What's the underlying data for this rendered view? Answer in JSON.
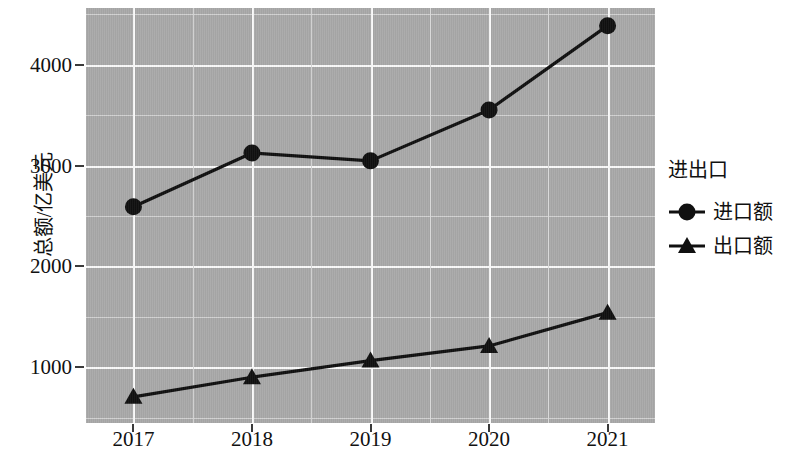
{
  "chart_data": {
    "type": "line",
    "title": "",
    "xlabel": "",
    "ylabel": "总额/亿美元",
    "categories": [
      "2017",
      "2018",
      "2019",
      "2020",
      "2021"
    ],
    "x": [
      2017,
      2018,
      2019,
      2020,
      2021
    ],
    "xlim": [
      2016.6,
      2021.4
    ],
    "ylim": [
      450,
      4560
    ],
    "y_ticks": [
      1000,
      2000,
      3000,
      4000
    ],
    "y_tick_labels": [
      "1000",
      "2000",
      "3000",
      "4000"
    ],
    "y_minor_ticks": [
      500,
      1500,
      2500,
      3500,
      4500
    ],
    "grid": true,
    "legend_position": "right",
    "legend_title": "进出口",
    "panel_color": "#a9a9a9",
    "grid_color": "#fafafa",
    "line_color": "#101010",
    "series": [
      {
        "name": "进口额",
        "marker": "circle",
        "color": "#101010",
        "values": [
          2591,
          3124,
          3046,
          3550,
          4385
        ]
      },
      {
        "name": "出口额",
        "marker": "triangle",
        "color": "#101010",
        "values": [
          709,
          903,
          1068,
          1213,
          1543
        ]
      }
    ]
  },
  "axes": {
    "y_title": "总额/亿美元",
    "x_tick_labels": [
      "2017",
      "2018",
      "2019",
      "2020",
      "2021"
    ],
    "y_tick_labels": [
      "1000",
      "2000",
      "3000",
      "4000"
    ]
  },
  "legend": {
    "title": "进出口",
    "items": [
      {
        "label": "进口额",
        "marker": "circle-marker"
      },
      {
        "label": "出口额",
        "marker": "triangle-marker"
      }
    ]
  }
}
